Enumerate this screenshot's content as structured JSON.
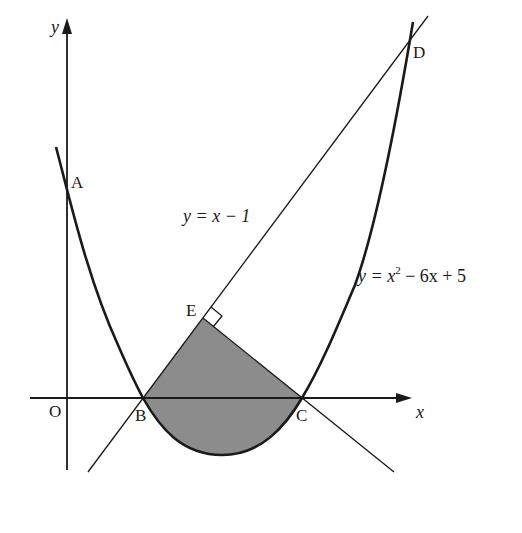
{
  "figure": {
    "type": "coordinate-geometry diagram",
    "shaded_region_color": "#8c8c8c",
    "line_color": "#1a1a1a",
    "axes": {
      "x_label": "x",
      "y_label": "y",
      "origin_label": "O"
    },
    "curves": [
      {
        "id": "parabola",
        "equation_lhs": "y = x",
        "equation_exp": "2",
        "equation_rest": " − 6x + 5"
      },
      {
        "id": "line",
        "equation": "y = x − 1"
      }
    ],
    "points": {
      "A": "A",
      "B": "B",
      "C": "C",
      "D": "D",
      "E": "E"
    },
    "annotations": {
      "right_angle_at": "E",
      "shaded_region": "bounded by BE, EC and the parabola arc from B to C"
    }
  }
}
